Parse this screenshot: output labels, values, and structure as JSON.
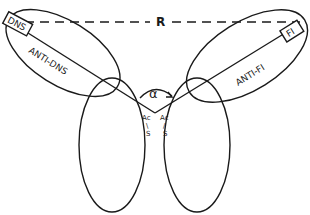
{
  "diagram": {
    "labels": {
      "distance": "R",
      "left_tag": "DNS",
      "left_arm": "ANTI-DNS",
      "right_tag": "FI",
      "right_arm": "ANTI-FI",
      "angle": "α",
      "hinge_left_top": "Ac",
      "hinge_left_mid": "\\",
      "hinge_left_bot": "S",
      "hinge_right_top": "Ac",
      "hinge_right_mid": "/",
      "hinge_right_bot": "S"
    },
    "colors": {
      "stroke": "#1a1a1a",
      "background": "#ffffff"
    }
  }
}
